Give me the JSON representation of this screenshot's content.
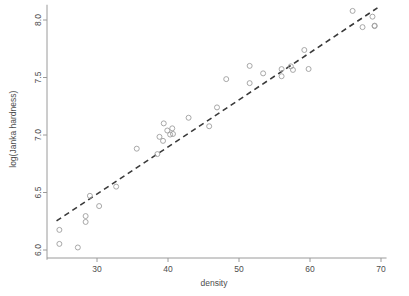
{
  "chart_data": {
    "type": "scatter",
    "title": "",
    "xlabel": "density",
    "ylabel": "log(Janka hardness)",
    "xlim": [
      23.5,
      70.5
    ],
    "ylim": [
      5.95,
      8.15
    ],
    "xticks": [
      30,
      40,
      50,
      60,
      70
    ],
    "xtick_labels": [
      "30",
      "40",
      "50",
      "60",
      "70"
    ],
    "yticks": [
      6.0,
      6.5,
      7.0,
      7.5,
      8.0
    ],
    "ytick_labels": [
      "6.0",
      "6.5",
      "7.0",
      "7.5",
      "8.0"
    ],
    "grid": false,
    "legend": null,
    "point_marker": "open-circle",
    "point_color": "#9e9e9e",
    "line_color": "#3a3a3a",
    "line_style": "dashed",
    "fit_line": {
      "label": "least-squares fit",
      "x": [
        24.3,
        69.5
      ],
      "y": [
        6.253,
        8.105
      ]
    },
    "x": [
      24.7,
      24.7,
      27.3,
      28.4,
      28.4,
      29.0,
      30.3,
      32.7,
      35.6,
      38.5,
      38.8,
      39.3,
      39.4,
      39.9,
      40.3,
      40.6,
      40.7,
      42.9,
      45.8,
      46.9,
      48.2,
      51.5,
      51.5,
      53.4,
      56.0,
      56.0,
      57.3,
      57.6,
      59.2,
      59.8,
      66.0,
      67.4,
      68.8,
      69.1,
      69.1
    ],
    "y": [
      6.175,
      6.053,
      6.022,
      6.295,
      6.244,
      6.471,
      6.382,
      6.551,
      6.881,
      6.834,
      6.984,
      6.949,
      7.101,
      7.039,
      7.004,
      7.058,
      7.009,
      7.15,
      7.076,
      7.24,
      7.486,
      7.601,
      7.451,
      7.536,
      7.573,
      7.511,
      7.597,
      7.566,
      7.739,
      7.574,
      8.079,
      7.938,
      8.029,
      7.947,
      7.951
    ]
  }
}
